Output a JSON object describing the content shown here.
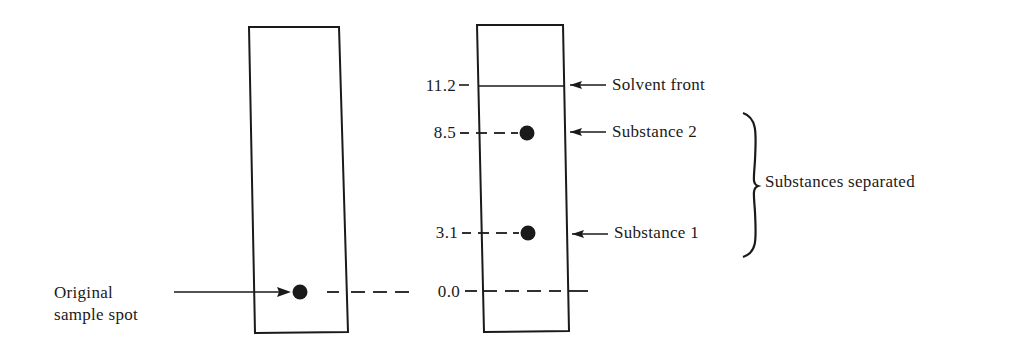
{
  "diagram": {
    "left_strip": {
      "label_line1": "Original",
      "label_line2": "sample spot"
    },
    "right_strip": {
      "ticks": [
        {
          "value": "11.2",
          "y": 86
        },
        {
          "value": "8.5",
          "y": 133
        },
        {
          "value": "3.1",
          "y": 233
        },
        {
          "value": "0.0",
          "y": 291
        }
      ],
      "annotations": {
        "solvent_front": "Solvent front",
        "substance_2": "Substance 2",
        "substance_1": "Substance 1",
        "group": "Substances separated"
      }
    },
    "colors": {
      "ink": "#1a1a1a",
      "background": "#ffffff"
    }
  }
}
